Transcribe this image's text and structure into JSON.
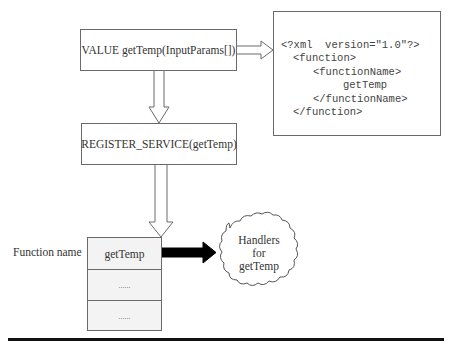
{
  "diagram": {
    "value_box": {
      "label": "VALUE  getTemp(InputParams[])"
    },
    "xml_box": {
      "lines": [
        "<?xml  version=\"1.0\"?>",
        "<function>",
        "<functionName>",
        "getTemp",
        "</functionName>",
        "</function>"
      ]
    },
    "register_box": {
      "label": "REGISTER_SERVICE(getTemp)"
    },
    "function_table": {
      "side_label": "Function name",
      "rows": [
        "getTemp",
        "......",
        "......"
      ]
    },
    "handler_cloud": {
      "lines": [
        "Handlers",
        "for",
        "getTemp"
      ]
    },
    "arrows": [
      {
        "from": "value_box",
        "to": "xml_box",
        "style": "hollow"
      },
      {
        "from": "value_box",
        "to": "register_box",
        "style": "hollow"
      },
      {
        "from": "register_box",
        "to": "function_table",
        "style": "hollow"
      },
      {
        "from": "function_table.rows.0",
        "to": "handler_cloud",
        "style": "solid-black"
      }
    ],
    "colors": {
      "stroke": "#6a6a6a",
      "text": "#333333",
      "table_fill": "#f3f3f3",
      "solid_arrow": "#000000",
      "rule": "#111111"
    }
  }
}
